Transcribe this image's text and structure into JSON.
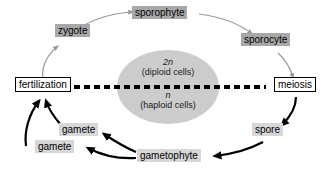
{
  "diagram": {
    "background_color": "#ffffff",
    "nodes": {
      "sporophyte": "sporophyte",
      "zygote": "zygote",
      "sporocyte": "sporocyte",
      "fertilization": "fertilization",
      "meiosis": "meiosis",
      "spore": "spore",
      "gametophyte": "gametophyte",
      "gamete_upper": "gamete",
      "gamete_lower": "gamete"
    },
    "center": {
      "diploid_symbol": "2n",
      "diploid_label": "(diploid cells)",
      "haploid_symbol": "n",
      "haploid_label": "(haploid cells)"
    },
    "colors": {
      "tag_dark": "#a8a8a8",
      "tag_light": "#d7d7d7",
      "ellipse_fill": "#cccccc",
      "diploid_arrow": "#999999",
      "haploid_arrow": "#000000",
      "divider": "#000000",
      "box_border": "#000000",
      "box_fill": "#ffffff"
    },
    "divider": {
      "style": "dashed",
      "width_px": 4
    }
  }
}
